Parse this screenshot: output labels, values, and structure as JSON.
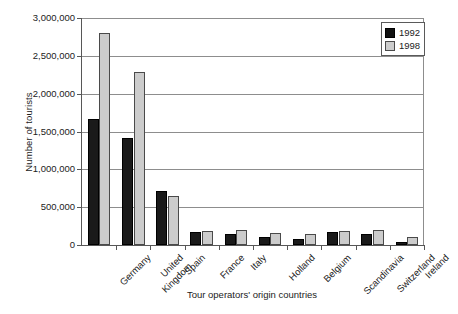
{
  "chart_data": {
    "type": "bar",
    "title": "",
    "xlabel": "Tour operators' origin countries",
    "ylabel": "Number of tourists",
    "categories": [
      "Germany",
      "United Kingdom",
      "Spain",
      "France",
      "Italy",
      "Holland",
      "Belgium",
      "Scandinavia",
      "Switzerland",
      "Ireland"
    ],
    "series": [
      {
        "name": "1992",
        "color": "#1a1a1a",
        "values": [
          1670000,
          1410000,
          710000,
          170000,
          150000,
          100000,
          80000,
          175000,
          150000,
          40000
        ]
      },
      {
        "name": "1998",
        "color": "#cccccc",
        "values": [
          2800000,
          2290000,
          650000,
          190000,
          200000,
          160000,
          150000,
          190000,
          200000,
          100000
        ]
      }
    ],
    "ylim": [
      0,
      3000000
    ],
    "yticks": [
      0,
      500000,
      1000000,
      1500000,
      2000000,
      2500000,
      3000000
    ],
    "ytick_labels": [
      "0",
      "500,000",
      "1,000,000",
      "1,500,000",
      "2,000,000",
      "2,500,000",
      "3,000,000"
    ],
    "grid": "horizontal",
    "legend_position": "top-right",
    "legend_entries": [
      "1992",
      "1998"
    ]
  },
  "axes": {
    "y_title": "Number of tourists",
    "x_title": "Tour operators' origin countries"
  },
  "legend": {
    "items": [
      {
        "label": "1992",
        "swatch": "black-square-icon"
      },
      {
        "label": "1998",
        "swatch": "gray-square-icon"
      }
    ]
  }
}
